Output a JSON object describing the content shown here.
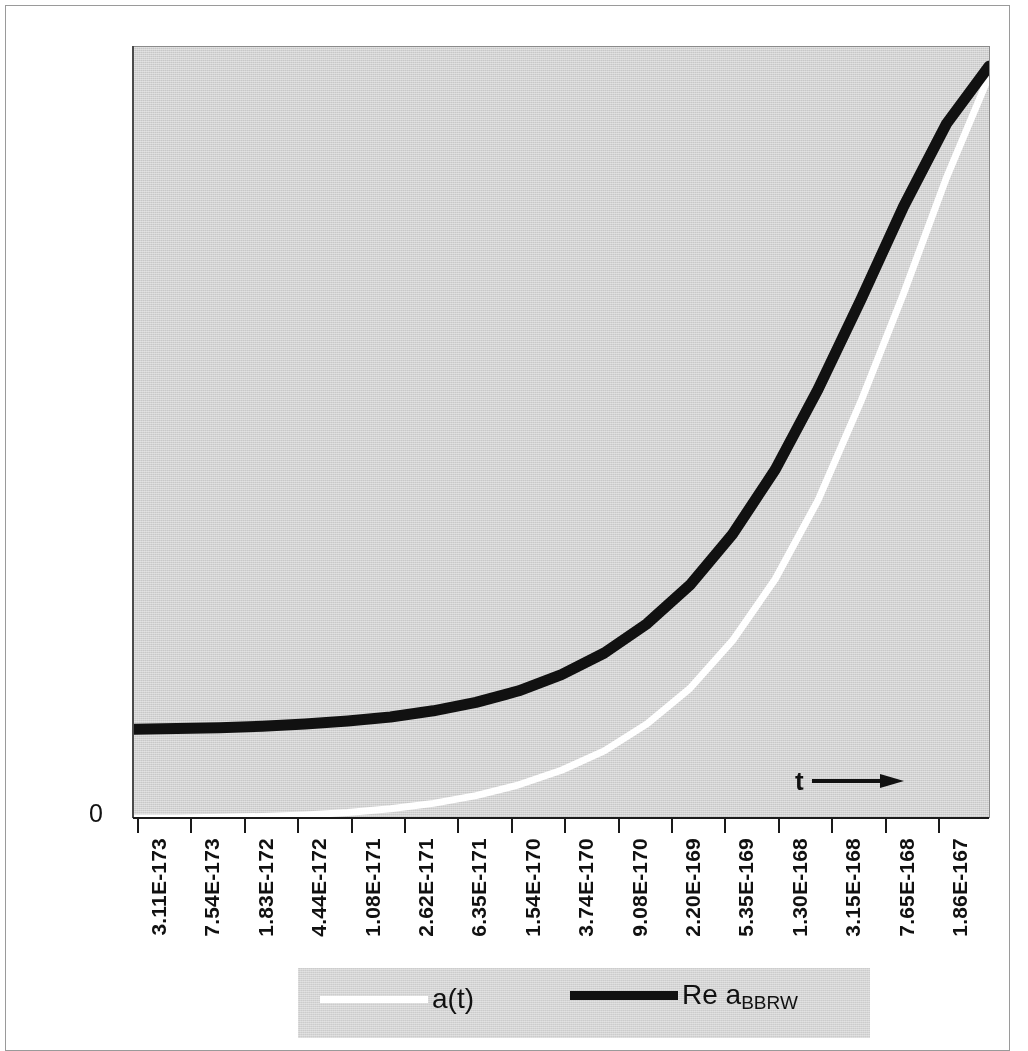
{
  "figure": {
    "background_color": "#ffffff",
    "plot_background_color": "#e2e2e2",
    "frame_color": "#9a9a9a"
  },
  "axis": {
    "y_zero_label": "0",
    "t_annotation_label": "t",
    "arrow_icon": "right-arrow-icon"
  },
  "legend": {
    "entries": [
      {
        "label": "a(t)",
        "color": "#ffffff",
        "style": "solid"
      },
      {
        "label_main": "Re a",
        "label_sub": "BBRW",
        "color": "#111111",
        "style": "solid"
      }
    ]
  },
  "chart_data": {
    "type": "line",
    "title": "",
    "subtitle": "",
    "xlabel": "t",
    "ylabel": "",
    "grid": false,
    "legend_position": "bottom",
    "x_tick_labels": [
      "3.11E-173",
      "7.54E-173",
      "1.83E-172",
      "4.44E-172",
      "1.08E-171",
      "2.62E-171",
      "6.35E-171",
      "1.54E-170",
      "3.74E-170",
      "9.08E-170",
      "2.20E-169",
      "5.35E-169",
      "1.30E-168",
      "3.15E-168",
      "7.65E-168",
      "1.86E-167",
      "4.51E-167"
    ],
    "y_tick_labels": [
      "0"
    ],
    "ylim": [
      0,
      1
    ],
    "series": [
      {
        "name": "a(t)",
        "color": "#ffffff",
        "line_width": 5,
        "comment": "scale factor a(t); stays near zero then grows exponentially",
        "x": [
          0,
          0.05,
          0.1,
          0.15,
          0.2,
          0.25,
          0.3,
          0.35,
          0.4,
          0.45,
          0.5,
          0.55,
          0.6,
          0.65,
          0.7,
          0.75,
          0.8,
          0.85,
          0.9,
          0.95,
          1.0
        ],
        "y": [
          0.0,
          0.0,
          0.001,
          0.002,
          0.004,
          0.007,
          0.012,
          0.019,
          0.029,
          0.043,
          0.062,
          0.087,
          0.122,
          0.168,
          0.23,
          0.31,
          0.412,
          0.54,
          0.68,
          0.83,
          0.962
        ]
      },
      {
        "name": "Re a_BBRW",
        "color": "#111111",
        "line_width": 9,
        "comment": "real part of BBRW scale factor; flat plateau then exponential rise",
        "x": [
          0,
          0.05,
          0.1,
          0.15,
          0.2,
          0.25,
          0.3,
          0.35,
          0.4,
          0.45,
          0.5,
          0.55,
          0.6,
          0.65,
          0.7,
          0.75,
          0.8,
          0.85,
          0.9,
          0.95,
          1.0
        ],
        "y": [
          0.115,
          0.116,
          0.117,
          0.119,
          0.122,
          0.126,
          0.131,
          0.139,
          0.15,
          0.165,
          0.186,
          0.214,
          0.252,
          0.302,
          0.368,
          0.452,
          0.556,
          0.672,
          0.793,
          0.9,
          0.975
        ]
      }
    ]
  }
}
